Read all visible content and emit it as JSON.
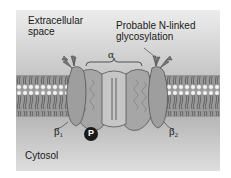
{
  "figure": {
    "regions": {
      "extracellular_line1": "Extracellular",
      "extracellular_line2": "space",
      "cytosol": "Cytosol"
    },
    "annotations": {
      "glycosylation_line1": "Probable N-linked",
      "glycosylation_line2": "glycosylation",
      "alpha": "α",
      "beta1_symbol": "β",
      "beta1_sub": "1",
      "beta2_symbol": "β",
      "beta2_sub": "2",
      "phosphate": "P"
    },
    "colors": {
      "extracellular_top": "#e8e8e8",
      "extracellular_bottom": "#bdbdbd",
      "cytosol_top": "#b8b8b8",
      "cytosol_bottom": "#dcdcdc",
      "membrane_tails": "#707070",
      "lipid_heads": "#f2f2f2",
      "protein_fill": "#a8a8a8",
      "protein_stroke": "#555555",
      "phosphate_fill": "#1a1a1a"
    }
  }
}
